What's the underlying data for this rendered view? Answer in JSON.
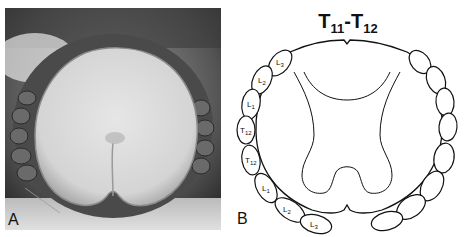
{
  "panel_a": {
    "label": "A",
    "description": "photograph of spinal cord cross-section with surrounding nerve roots"
  },
  "panel_b": {
    "label": "B",
    "title_base": "T",
    "title_sub1": "11",
    "title_dash": "-",
    "title_sub2": "12",
    "roots": [
      {
        "base": "L",
        "sub": "3"
      },
      {
        "base": "L",
        "sub": "2"
      },
      {
        "base": "L",
        "sub": "1"
      },
      {
        "base": "T",
        "sub": "12"
      },
      {
        "base": "T",
        "sub": "12"
      },
      {
        "base": "L",
        "sub": "1"
      },
      {
        "base": "L",
        "sub": "2"
      },
      {
        "base": "L",
        "sub": "3"
      }
    ]
  }
}
